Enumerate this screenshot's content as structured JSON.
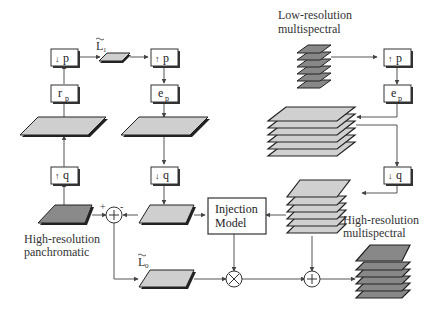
{
  "diagram": {
    "type": "block-diagram",
    "colors": {
      "line": "#555555",
      "light_fill": "#cfcfcf",
      "dark_fill": "#8a8a8a",
      "edge": "#222222",
      "box_fill": "#ffffff"
    },
    "labels": {
      "lowres_ms_line1": "Low-resolution",
      "lowres_ms_line2": "multispectral",
      "highres_pan_line1": "High-resolution",
      "highres_pan_line2": "panchromatic",
      "highres_ms_line1": "High-resolution",
      "highres_ms_line2": "multispectral",
      "injection_line1": "Injection",
      "injection_line2": "Model",
      "L1": "L",
      "L1_sub": "1",
      "L0": "L",
      "L0_sub": "0",
      "plus_sign": "+",
      "minus_sign": "-"
    },
    "blocks": {
      "down_p": {
        "arrow": "↓",
        "label": "p"
      },
      "r_p": {
        "label": "r",
        "sub": "p"
      },
      "up_p_left": {
        "arrow": "↑",
        "label": "p"
      },
      "e_p_left": {
        "label": "e",
        "sub": "p"
      },
      "up_q": {
        "arrow": "↑",
        "label": "q"
      },
      "down_q_left": {
        "arrow": "↓",
        "label": "q"
      },
      "up_p_right": {
        "arrow": "↑",
        "label": "p"
      },
      "e_p_right": {
        "label": "e",
        "sub": "p"
      },
      "down_q_right": {
        "arrow": "↓",
        "label": "q"
      }
    },
    "operators": {
      "subtract": "+",
      "multiply": "×",
      "add": "+"
    }
  }
}
